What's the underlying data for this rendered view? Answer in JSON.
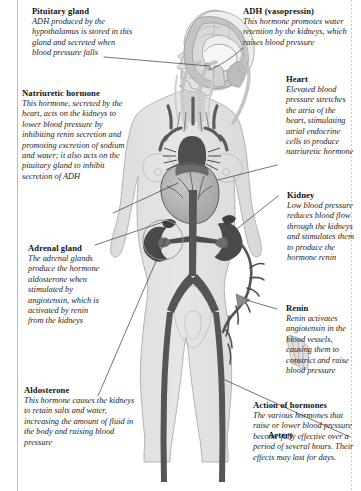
{
  "figure": {
    "palette": {
      "body_fill": "#e3e3e3",
      "body_outline": "#9a9a9a",
      "organ_dark": "#4a4a4a",
      "vessel_dark": "#555555",
      "brain_mid": "#b9b9b9",
      "brain_light": "#d6d6d6",
      "leader_line": "#3a3a3a",
      "page_background": "#ffffff",
      "text": "#1a1a1a"
    }
  },
  "callouts": {
    "pituitary": {
      "heading": "Pituitary gland",
      "body": "ADH produced by the hypothalamus is stored in this gland and secreted when blood pressure falls"
    },
    "natriuretic": {
      "heading": "Natriuretic hormone",
      "body": "This hormone, secreted by the heart, acts on the kidneys to lower blood pressure by inhibiting renin secretion and promoting excretion of sodium and water; it also acts on the pituitary gland to inhibit secretion of ADH"
    },
    "adrenal": {
      "heading": "Adrenal gland",
      "body": "The adrenal glands produce the hormone aldosterone when stimulated by angiotensin, which is activated by renin from the kidneys"
    },
    "aldosterone": {
      "heading": "Aldosterone",
      "body": "This hormone causes the kidneys to retain salts and water, increasing the amount of fluid in the body and raising blood pressure"
    },
    "adh": {
      "heading": "ADH (vasopressin)",
      "body": "This hormone promotes water retention by the kidneys, which raises blood pressure"
    },
    "heart": {
      "heading": "Heart",
      "body": "Elevated blood pressure stretches the atria of the heart, stimulating atrial endocrine cells to produce natriuretic hormone"
    },
    "kidney": {
      "heading": "Kidney",
      "body": "Low blood pressure reduces blood flow through the kidneys and stimulates them to produce the hormone renin"
    },
    "renin": {
      "heading": "Renin",
      "body": "Renin activates angiotensin in the blood vessels, causing them to constrict and raise blood pressure"
    },
    "action": {
      "heading": "Action of hormones",
      "body": "The various hormones that raise or lower blood pressure become fully effective over a period of several hours. Their effects may last for days."
    },
    "artery": {
      "heading": "Artery",
      "body": ""
    }
  }
}
